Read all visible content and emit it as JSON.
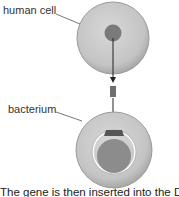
{
  "labels": {
    "human_cell": "human cell",
    "bacterium": "bacterium"
  },
  "caption": "The gene is then inserted into the DN",
  "colors": {
    "cell_fill": "#c8c8c8",
    "cell_edge": "#9a9a9a",
    "nucleus": "#7a7a7a",
    "gene": "#6e6e6e",
    "plasmid_ring": "#ffffff",
    "bacterial_dna": "#8c8c8c",
    "arrow": "#222222"
  }
}
